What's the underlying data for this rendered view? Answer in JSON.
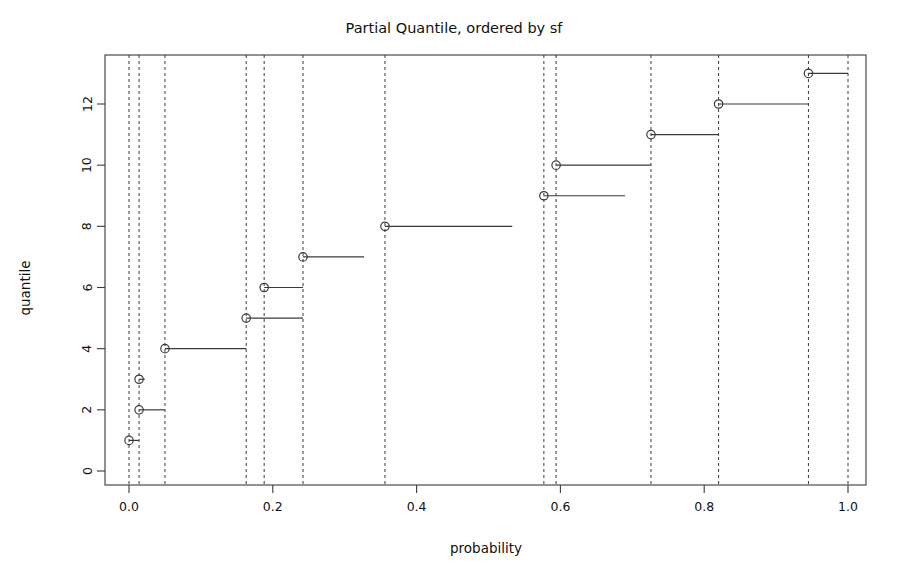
{
  "chart_data": {
    "type": "line",
    "subtype": "step-function-empirical-quantile",
    "title": "Partial Quantile, ordered by sf",
    "xlabel": "probability",
    "ylabel": "quantile",
    "xlim": [
      -0.04,
      1.04
    ],
    "ylim": [
      -0.6,
      13.8
    ],
    "xticks": [
      0.0,
      0.2,
      0.4,
      0.6,
      0.8,
      1.0
    ],
    "xtick_labels": [
      "0.0",
      "0.2",
      "0.4",
      "0.6",
      "0.8",
      "1.0"
    ],
    "yticks": [
      0,
      2,
      4,
      6,
      8,
      10,
      12
    ],
    "ytick_labels": [
      "0",
      "2",
      "4",
      "6",
      "8",
      "10",
      "12"
    ],
    "grid": false,
    "legend": null,
    "box": true,
    "point_marker": "open-circle",
    "line_color": "#3a3a3a",
    "vline_color": "#3a3a3a",
    "vline_style": "dashed",
    "background": "#ffffff",
    "vlines": [
      0.0,
      0.014,
      0.05,
      0.163,
      0.188,
      0.242,
      0.356,
      0.577,
      0.594,
      0.726,
      0.82,
      0.945,
      1.0
    ],
    "steps": [
      {
        "quantile": 1,
        "p_start": 0.0,
        "p_end": 0.014
      },
      {
        "quantile": 2,
        "p_start": 0.014,
        "p_end": 0.05
      },
      {
        "quantile": 3,
        "p_start": 0.014,
        "p_end": 0.022
      },
      {
        "quantile": 4,
        "p_start": 0.05,
        "p_end": 0.163
      },
      {
        "quantile": 5,
        "p_start": 0.163,
        "p_end": 0.242
      },
      {
        "quantile": 6,
        "p_start": 0.188,
        "p_end": 0.242
      },
      {
        "quantile": 7,
        "p_start": 0.242,
        "p_end": 0.327
      },
      {
        "quantile": 8,
        "p_start": 0.356,
        "p_end": 0.533
      },
      {
        "quantile": 9,
        "p_start": 0.577,
        "p_end": 0.69
      },
      {
        "quantile": 10,
        "p_start": 0.594,
        "p_end": 0.726
      },
      {
        "quantile": 11,
        "p_start": 0.726,
        "p_end": 0.82
      },
      {
        "quantile": 12,
        "p_start": 0.82,
        "p_end": 0.945
      },
      {
        "quantile": 13,
        "p_start": 0.945,
        "p_end": 1.0
      }
    ],
    "points": [
      {
        "p": 0.0,
        "quantile": 1
      },
      {
        "p": 0.014,
        "quantile": 2
      },
      {
        "p": 0.014,
        "quantile": 3
      },
      {
        "p": 0.05,
        "quantile": 4
      },
      {
        "p": 0.163,
        "quantile": 5
      },
      {
        "p": 0.188,
        "quantile": 6
      },
      {
        "p": 0.242,
        "quantile": 7
      },
      {
        "p": 0.356,
        "quantile": 8
      },
      {
        "p": 0.577,
        "quantile": 9
      },
      {
        "p": 0.594,
        "quantile": 10
      },
      {
        "p": 0.726,
        "quantile": 11
      },
      {
        "p": 0.82,
        "quantile": 12
      },
      {
        "p": 0.945,
        "quantile": 13
      }
    ]
  }
}
